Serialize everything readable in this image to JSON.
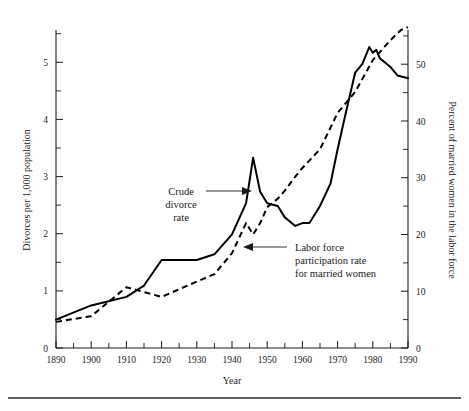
{
  "chart_data": {
    "type": "line",
    "title": "",
    "xlabel": "Year",
    "ylabel": "Divorces per 1,000 population",
    "y2label": "Percent of married women in the labor force",
    "xlim": [
      1890,
      1990
    ],
    "ylim": [
      0,
      5.6
    ],
    "y2lim": [
      0,
      56
    ],
    "grid": false,
    "legend_position": "inline-annotations",
    "x_ticks_major": [
      1890,
      1900,
      1910,
      1920,
      1930,
      1940,
      1950,
      1960,
      1970,
      1980,
      1990
    ],
    "x_ticks_minor": [
      1895,
      1905,
      1915,
      1925,
      1935,
      1945,
      1955,
      1965,
      1975,
      1985
    ],
    "y_ticks_major": [
      0,
      1,
      2,
      3,
      4,
      5
    ],
    "y_ticks_minor": [
      0.5,
      1.5,
      2.5,
      3.5,
      4.5,
      5.5
    ],
    "y2_ticks_major": [
      0,
      10,
      20,
      30,
      40,
      50
    ],
    "y2_ticks_minor": [
      5,
      15,
      25,
      35,
      45,
      55
    ],
    "series": [
      {
        "name": "Crude divorce rate",
        "style": "solid",
        "axis": "left",
        "units": "divorces per 1,000 population",
        "x": [
          1890,
          1900,
          1910,
          1915,
          1920,
          1930,
          1935,
          1940,
          1944,
          1946,
          1948,
          1950,
          1953,
          1955,
          1958,
          1960,
          1962,
          1965,
          1968,
          1970,
          1972,
          1975,
          1977,
          1979,
          1980,
          1981,
          1982,
          1984,
          1985,
          1987,
          1990
        ],
        "values": [
          0.5,
          0.75,
          0.9,
          1.1,
          1.55,
          1.55,
          1.65,
          2.0,
          2.55,
          3.35,
          2.75,
          2.55,
          2.5,
          2.3,
          2.15,
          2.2,
          2.2,
          2.5,
          2.9,
          3.5,
          4.05,
          4.85,
          5.0,
          5.3,
          5.2,
          5.25,
          5.1,
          5.0,
          4.95,
          4.8,
          4.75
        ]
      },
      {
        "name": "Labor force participation rate for married women",
        "style": "dashed",
        "axis": "right",
        "units": "percent of married women in the labor force",
        "x": [
          1890,
          1900,
          1910,
          1920,
          1930,
          1935,
          1940,
          1944,
          1946,
          1948,
          1950,
          1953,
          1955,
          1958,
          1960,
          1965,
          1970,
          1975,
          1980,
          1985,
          1988,
          1990
        ],
        "values": [
          4.6,
          5.6,
          10.7,
          9.0,
          11.7,
          13.0,
          16.7,
          22.0,
          20.0,
          22.0,
          24.8,
          26.3,
          27.7,
          30.2,
          31.7,
          35.0,
          41.4,
          45.1,
          50.7,
          54.2,
          56.0,
          56.5
        ]
      }
    ],
    "annotations": [
      {
        "text_lines": [
          "Crude",
          "divorce",
          "rate"
        ],
        "points_to": "solid-series",
        "arrow_direction": "right"
      },
      {
        "text_lines": [
          "Labor force",
          "participation rate",
          "for married women"
        ],
        "points_to": "dashed-series",
        "arrow_direction": "left"
      }
    ]
  },
  "axes": {
    "left": {
      "title": "Divorces per 1,000 population",
      "tick_labels": [
        "0",
        "1",
        "2",
        "3",
        "4",
        "5"
      ]
    },
    "right": {
      "title": "Percent of married women in the labor force",
      "tick_labels": [
        "0",
        "10",
        "20",
        "30",
        "40",
        "50"
      ]
    },
    "bottom": {
      "title": "Year",
      "tick_labels": [
        "1890",
        "1900",
        "1910",
        "1920",
        "1930",
        "1940",
        "1950",
        "1960",
        "1970",
        "1980",
        "1990"
      ]
    }
  },
  "annotation_text": {
    "crude_line1": "Crude",
    "crude_line2": "divorce",
    "crude_line3": "rate",
    "labor_line1": "Labor force",
    "labor_line2": "participation rate",
    "labor_line3": "for married women"
  },
  "colors": {
    "ink": "#1a1a1a",
    "series": "#000000",
    "background": "#ffffff",
    "rule": "#2a2a2a"
  }
}
